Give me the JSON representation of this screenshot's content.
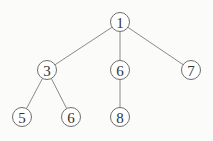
{
  "diagram": {
    "type": "tree",
    "node_radius": 9.5,
    "colors": {
      "background": "#fbfbfa",
      "edge": "#8a8a8a",
      "node_stroke": "#6e6e6e",
      "node_fill": "#ffffff",
      "label": "#333333"
    },
    "nodes": [
      {
        "id": "n1",
        "label": "1",
        "x": 120,
        "y": 22
      },
      {
        "id": "n3",
        "label": "3",
        "x": 47,
        "y": 70
      },
      {
        "id": "n6a",
        "label": "6",
        "x": 120,
        "y": 70
      },
      {
        "id": "n7",
        "label": "7",
        "x": 191,
        "y": 70
      },
      {
        "id": "n5",
        "label": "5",
        "x": 22,
        "y": 117
      },
      {
        "id": "n6b",
        "label": "6",
        "x": 71,
        "y": 117
      },
      {
        "id": "n8",
        "label": "8",
        "x": 120,
        "y": 117
      }
    ],
    "edges": [
      {
        "from": "n1",
        "to": "n3"
      },
      {
        "from": "n1",
        "to": "n6a"
      },
      {
        "from": "n1",
        "to": "n7"
      },
      {
        "from": "n3",
        "to": "n5"
      },
      {
        "from": "n3",
        "to": "n6b"
      },
      {
        "from": "n6a",
        "to": "n8"
      }
    ]
  }
}
